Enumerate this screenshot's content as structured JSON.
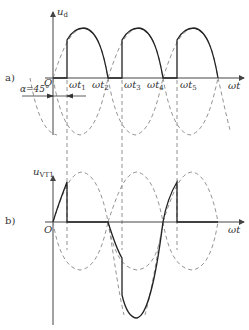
{
  "panel_a": {
    "tag": "a)",
    "y_axis_label": "u",
    "y_axis_sub": "d",
    "x_axis_label": "ωt",
    "origin_label": "O",
    "alpha_label": "α=45°",
    "time_labels": [
      {
        "main": "ωt",
        "sub": "1"
      },
      {
        "main": "ωt",
        "sub": "2"
      },
      {
        "main": "ωt",
        "sub": "3"
      },
      {
        "main": "ωt",
        "sub": "4"
      },
      {
        "main": "ωt",
        "sub": "5"
      }
    ]
  },
  "panel_b": {
    "tag": "b)",
    "y_axis_label": "u",
    "y_axis_sub": "VT1",
    "x_axis_label": "ωt",
    "origin_label": "O"
  },
  "colors": {
    "solid": "#333333",
    "dashed": "#777777",
    "axis": "#444444"
  }
}
